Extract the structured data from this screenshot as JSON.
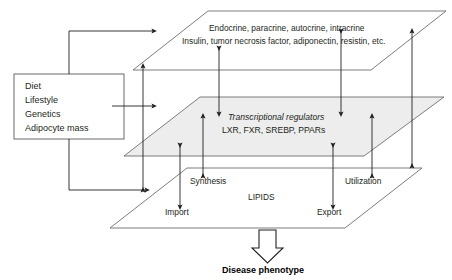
{
  "diagram": {
    "title_outcome": "Disease phenotype",
    "planes": {
      "top": {
        "name": "secreted-factors-plane",
        "line1": "Endocrine, paracrine, autocrine, intracrine",
        "line2": "Insulin, tumor necrosis factor, adiponectin, resistin, etc.",
        "fill": "#ffffff",
        "stroke": "#6d6e71"
      },
      "middle": {
        "name": "transcriptional-regulators-plane",
        "line1": "Transcriptional regulators",
        "line2": "LXR, FXR, SREBP, PPARs",
        "fill": "#ededed",
        "stroke": "#6d6e71"
      },
      "bottom": {
        "name": "lipids-plane",
        "label": "LIPIDS",
        "fill": "#ffffff",
        "stroke": "#6d6e71"
      }
    },
    "input_box": {
      "items": [
        "Diet",
        "Lifestyle",
        "Genetics",
        "Adipocyte mass"
      ],
      "stroke": "#58595b"
    },
    "process_labels": [
      {
        "id": "synthesis",
        "label": "Synthesis"
      },
      {
        "id": "import",
        "label": "Import"
      },
      {
        "id": "export",
        "label": "Export"
      },
      {
        "id": "utilization",
        "label": "Utilization"
      }
    ],
    "arrow_color": "#231f20",
    "block_arrow": {
      "name": "disease-phenotype-arrow",
      "fill": "#ffffff",
      "stroke": "#231f20"
    }
  }
}
